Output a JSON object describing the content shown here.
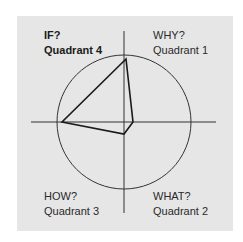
{
  "diagram": {
    "type": "quadrant-radar",
    "colors": {
      "background": "#ffffff",
      "panel": "#e6e6e6",
      "axis": "#333333",
      "circle": "#333333",
      "polygon": "#1a1a1a",
      "text": "#2a2a2a"
    },
    "quadrants": [
      {
        "id": "q4",
        "question": "IF?",
        "name": "Quadrant 4",
        "position": "top-left",
        "bold": true
      },
      {
        "id": "q1",
        "question": "WHY?",
        "name": "Quadrant 1",
        "position": "top-right",
        "bold": false
      },
      {
        "id": "q3",
        "question": "HOW?",
        "name": "Quadrant 3",
        "position": "bottom-left",
        "bold": false
      },
      {
        "id": "q2",
        "question": "WHAT?",
        "name": "Quadrant 2",
        "position": "bottom-right",
        "bold": false
      }
    ],
    "polygon_points": [
      {
        "direction": "up",
        "quadrant_axis": "IF/WHY",
        "x": 126,
        "y": 59
      },
      {
        "direction": "right",
        "quadrant_axis": "WHY/WHAT",
        "x": 133,
        "y": 122
      },
      {
        "direction": "down",
        "quadrant_axis": "WHAT/HOW",
        "x": 124,
        "y": 134
      },
      {
        "direction": "left",
        "quadrant_axis": "HOW/IF",
        "x": 62,
        "y": 122
      }
    ]
  }
}
